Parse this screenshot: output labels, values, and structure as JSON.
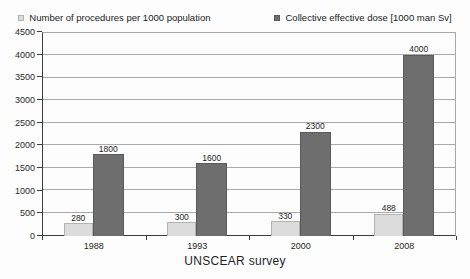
{
  "chart_data": {
    "type": "bar",
    "title": "",
    "xlabel": "UNSCEAR survey",
    "ylabel": "",
    "categories": [
      "1988",
      "1993",
      "2000",
      "2008"
    ],
    "series": [
      {
        "name": "Number of procedures per 1000 population",
        "values": [
          280,
          300,
          330,
          488
        ],
        "color": "#dcdcdc",
        "border": "#b2b2b2"
      },
      {
        "name": "Collective effective dose [1000 man Sv]",
        "values": [
          1800,
          1600,
          2300,
          4000
        ],
        "color": "#6e6e6e",
        "border": "#5a5a5a"
      }
    ],
    "ylim": [
      0,
      4500
    ],
    "ytick_step": 500,
    "grid": "horizontal",
    "legend_position": "top"
  },
  "colors": {
    "background": "#fdfdfd",
    "gridline": "#aaaaaa",
    "axis": "#3c3c3c",
    "text": "#1f1f1f"
  }
}
